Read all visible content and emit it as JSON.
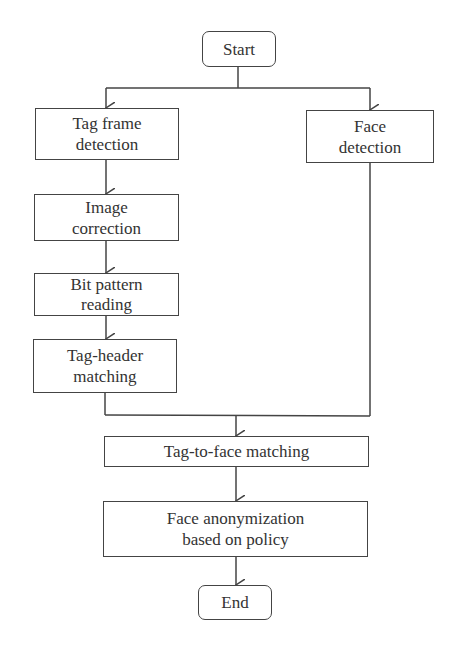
{
  "diagram": {
    "type": "flowchart",
    "nodes": {
      "start": "Start",
      "tag_frame": "Tag frame detection",
      "face_detection": "Face detection",
      "image_correction": "Image correction",
      "bit_pattern": "Bit pattern reading",
      "tag_header": "Tag-header matching",
      "tag_to_face": "Tag-to-face matching",
      "anonymization": "Face anonymization based on policy",
      "end": "End"
    },
    "edges": [
      [
        "Start",
        "Tag frame detection"
      ],
      [
        "Start",
        "Face detection"
      ],
      [
        "Tag frame detection",
        "Image correction"
      ],
      [
        "Image correction",
        "Bit pattern reading"
      ],
      [
        "Bit pattern reading",
        "Tag-header matching"
      ],
      [
        "Tag-header matching",
        "Tag-to-face matching"
      ],
      [
        "Face detection",
        "Tag-to-face matching"
      ],
      [
        "Tag-to-face matching",
        "Face anonymization based on policy"
      ],
      [
        "Face anonymization based on policy",
        "End"
      ]
    ]
  }
}
